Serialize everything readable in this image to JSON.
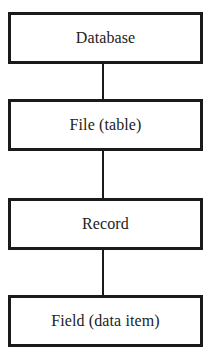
{
  "diagram": {
    "type": "hierarchy",
    "orientation": "vertical",
    "nodes": [
      {
        "id": "database",
        "label": "Database"
      },
      {
        "id": "file",
        "label": "File (table)"
      },
      {
        "id": "record",
        "label": "Record"
      },
      {
        "id": "field",
        "label": "Field (data item)"
      }
    ],
    "edges": [
      {
        "from": "database",
        "to": "file"
      },
      {
        "from": "file",
        "to": "record"
      },
      {
        "from": "record",
        "to": "field"
      }
    ],
    "colors": {
      "border": "#1a1a1a",
      "text": "#222222",
      "background": "#ffffff"
    }
  }
}
